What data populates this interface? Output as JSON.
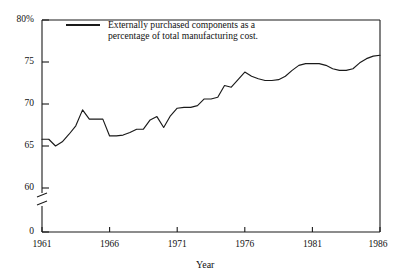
{
  "chart_data": {
    "type": "line",
    "title": "",
    "subtitle": "",
    "xlabel": "Year",
    "ylabel": "",
    "legend": [
      {
        "name": "Externally purchased components as a percentage of total manufacturing cost.",
        "line1": "Externally purchased components as a",
        "line2": "percentage of total manufacturing cost.",
        "color": "#1a1a1a"
      }
    ],
    "legend_position": "top-left-inside",
    "grid": false,
    "axis_break": true,
    "axis_break_note": "y-axis broken between 0 and 60",
    "xlim": [
      1961,
      1986
    ],
    "ylim": [
      60,
      80
    ],
    "xticks": [
      1961,
      1966,
      1971,
      1976,
      1981,
      1986
    ],
    "xtick_labels": [
      "1961",
      "1966",
      "1971",
      "1976",
      "1981",
      "1986"
    ],
    "yticks": [
      0,
      60,
      65,
      70,
      75,
      80
    ],
    "ytick_labels": [
      "0",
      "60",
      "65",
      "70",
      "75",
      "80%"
    ],
    "x": [
      1961,
      1961.5,
      1962,
      1962.5,
      1963,
      1963.5,
      1964,
      1964.5,
      1965,
      1965.5,
      1966,
      1966.5,
      1967,
      1967.5,
      1968,
      1968.5,
      1969,
      1969.5,
      1970,
      1970.5,
      1971,
      1971.5,
      1972,
      1972.5,
      1973,
      1973.5,
      1974,
      1974.5,
      1975,
      1975.5,
      1976,
      1976.5,
      1977,
      1977.5,
      1978,
      1978.5,
      1979,
      1979.5,
      1980,
      1980.5,
      1981,
      1981.5,
      1982,
      1982.5,
      1983,
      1983.5,
      1984,
      1984.5,
      1985,
      1985.5,
      1986
    ],
    "values": [
      65.8,
      65.8,
      65.0,
      65.5,
      66.4,
      67.4,
      69.3,
      68.2,
      68.2,
      68.2,
      66.2,
      66.2,
      66.3,
      66.6,
      67.0,
      67.0,
      68.1,
      68.5,
      67.2,
      68.6,
      69.5,
      69.6,
      69.6,
      69.8,
      70.6,
      70.6,
      70.8,
      72.2,
      72.0,
      72.9,
      73.8,
      73.3,
      73.0,
      72.8,
      72.8,
      72.9,
      73.3,
      74.0,
      74.6,
      74.8,
      74.8,
      74.8,
      74.6,
      74.2,
      74.0,
      74.0,
      74.2,
      74.9,
      75.4,
      75.7,
      75.8
    ],
    "series": [
      {
        "name": "Externally purchased components as a percentage of total manufacturing cost.",
        "color": "#1a1a1a",
        "values": [
          65.8,
          65.8,
          65.0,
          65.5,
          66.4,
          67.4,
          69.3,
          68.2,
          68.2,
          68.2,
          66.2,
          66.2,
          66.3,
          66.6,
          67.0,
          67.0,
          68.1,
          68.5,
          67.2,
          68.6,
          69.5,
          69.6,
          69.6,
          69.8,
          70.6,
          70.6,
          70.8,
          72.2,
          72.0,
          72.9,
          73.8,
          73.3,
          73.0,
          72.8,
          72.8,
          72.9,
          73.3,
          74.0,
          74.6,
          74.8,
          74.8,
          74.8,
          74.6,
          74.2,
          74.0,
          74.0,
          74.2,
          74.9,
          75.4,
          75.7,
          75.8
        ]
      }
    ]
  },
  "colors": {
    "line": "#1a1a1a",
    "frame": "#1a1a1a",
    "background": "#ffffff",
    "text": "#111111"
  }
}
